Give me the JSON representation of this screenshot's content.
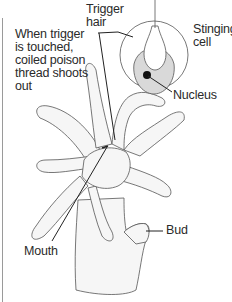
{
  "diagram": {
    "labels": {
      "trigger_action": "When trigger\nis touched,\ncoiled poison\nthread shoots\nout",
      "trigger_hair": "Trigger\nhair",
      "stinging_cell": "Stinging\ncell",
      "nucleus": "Nucleus",
      "bud": "Bud",
      "mouth": "Mouth"
    },
    "colors": {
      "ink": "#2a2a2a",
      "body_fill": "#f4f4f4",
      "cell_fill": "#d9d9d9",
      "nucleus_fill": "#111111"
    }
  }
}
